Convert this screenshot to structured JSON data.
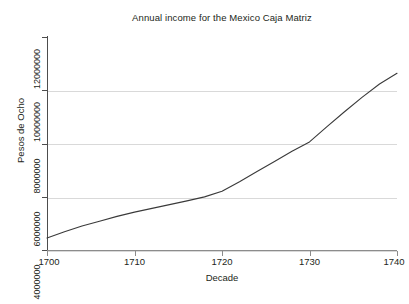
{
  "chart_data": {
    "type": "line",
    "title": "Annual income for the Mexico Caja Matriz",
    "xlabel": "Decade",
    "ylabel": "Pesos de Ocho",
    "xlim": [
      1700,
      1740
    ],
    "ylim": [
      4000000,
      12000000
    ],
    "grid": true,
    "legend": null,
    "x_ticks": [
      1700,
      1710,
      1720,
      1730,
      1740
    ],
    "x_tick_labels": [
      "1700",
      "1710",
      "1720",
      "1730",
      "1740"
    ],
    "y_ticks": [
      4000000,
      6000000,
      8000000,
      10000000,
      12000000
    ],
    "y_tick_labels": [
      "4000000",
      "6000000",
      "8000000",
      "10000000",
      "12000000"
    ],
    "line_color": "#3a3a3a",
    "series": [
      {
        "name": "Annual income",
        "x": [
          1700,
          1702,
          1704,
          1706,
          1708,
          1710,
          1712,
          1714,
          1716,
          1718,
          1720,
          1722,
          1724,
          1726,
          1728,
          1730,
          1732,
          1734,
          1736,
          1738,
          1740
        ],
        "values": [
          4450000,
          4680000,
          4900000,
          5080000,
          5260000,
          5420000,
          5560000,
          5700000,
          5840000,
          5990000,
          6200000,
          6560000,
          6940000,
          7320000,
          7700000,
          8050000,
          8620000,
          9180000,
          9720000,
          10220000,
          10620000
        ]
      }
    ]
  },
  "figure": {
    "background_color": "#ffffff",
    "gridline_color": "#d9d9d9",
    "axis_color": "#4d4d4d"
  }
}
